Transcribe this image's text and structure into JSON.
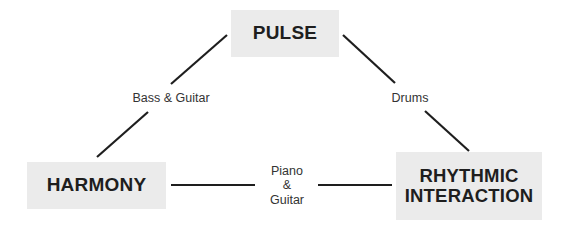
{
  "diagram": {
    "nodes": [
      {
        "id": "pulse",
        "label": "PULSE"
      },
      {
        "id": "harmony",
        "label": "HARMONY"
      },
      {
        "id": "rhythmic_interaction",
        "label_lines": [
          "RHYTHMIC",
          "INTERACTION"
        ]
      }
    ],
    "edges": [
      {
        "from": "harmony",
        "to": "pulse",
        "label": "Bass & Guitar"
      },
      {
        "from": "pulse",
        "to": "rhythmic_interaction",
        "label": "Drums"
      },
      {
        "from": "harmony",
        "to": "rhythmic_interaction",
        "label_lines": [
          "Piano",
          "&",
          "Guitar"
        ]
      }
    ],
    "colors": {
      "node_fill": "#ebebeb",
      "node_text": "#1e1e1e",
      "edge": "#1e1e1e",
      "edge_label": "#333333",
      "background": "#ffffff"
    }
  }
}
